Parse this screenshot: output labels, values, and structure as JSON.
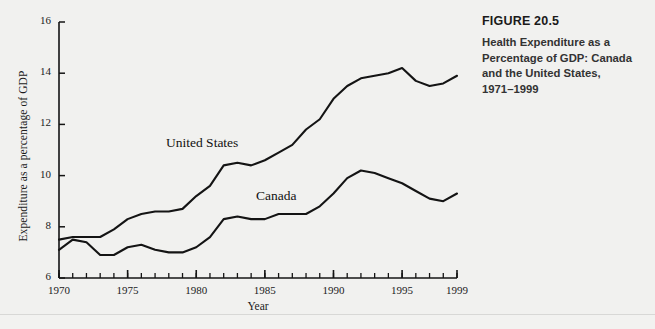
{
  "caption": {
    "figure_number": "FIGURE 20.5",
    "lines": [
      "Health Expenditure as a",
      "Percentage of GDP: Canada",
      "and the United States,",
      "1971–1999"
    ]
  },
  "axes": {
    "x_axis_label": "Year",
    "y_axis_label": "Expenditure as a percentage of GDP",
    "x_tick_labels": [
      "1970",
      "1975",
      "1980",
      "1985",
      "1990",
      "1995",
      "1999"
    ],
    "y_tick_labels": [
      "6",
      "8",
      "10",
      "12",
      "14",
      "16"
    ]
  },
  "series_labels": {
    "united_states": "United States",
    "canada": "Canada"
  },
  "chart_data": {
    "type": "line",
    "xlabel": "Year",
    "ylabel": "Expenditure as a percentage of GDP",
    "xlim": [
      1970,
      1999
    ],
    "ylim": [
      6,
      16
    ],
    "xticks": [
      1970,
      1975,
      1980,
      1985,
      1990,
      1995,
      1999
    ],
    "yticks": [
      6,
      8,
      10,
      12,
      14,
      16
    ],
    "minor_xticks_interval": 1,
    "grid": false,
    "legend": "inline-labels",
    "line_color": "#141414",
    "x": [
      1970,
      1971,
      1972,
      1973,
      1974,
      1975,
      1976,
      1977,
      1978,
      1979,
      1980,
      1981,
      1982,
      1983,
      1984,
      1985,
      1986,
      1987,
      1988,
      1989,
      1990,
      1991,
      1992,
      1993,
      1994,
      1995,
      1996,
      1997,
      1998,
      1999
    ],
    "series": [
      {
        "name": "United States",
        "values": [
          7.5,
          7.6,
          7.6,
          7.6,
          7.9,
          8.3,
          8.5,
          8.6,
          8.6,
          8.7,
          9.2,
          9.6,
          10.4,
          10.5,
          10.4,
          10.6,
          10.9,
          11.2,
          11.8,
          12.2,
          13.0,
          13.5,
          13.8,
          13.9,
          14.0,
          14.2,
          13.7,
          13.5,
          13.6,
          13.9
        ]
      },
      {
        "name": "Canada",
        "values": [
          7.1,
          7.5,
          7.4,
          6.9,
          6.9,
          7.2,
          7.3,
          7.1,
          7.0,
          7.0,
          7.2,
          7.6,
          8.3,
          8.4,
          8.3,
          8.3,
          8.5,
          8.5,
          8.5,
          8.8,
          9.3,
          9.9,
          10.2,
          10.1,
          9.9,
          9.7,
          9.4,
          9.1,
          9.0,
          9.3
        ]
      }
    ]
  }
}
